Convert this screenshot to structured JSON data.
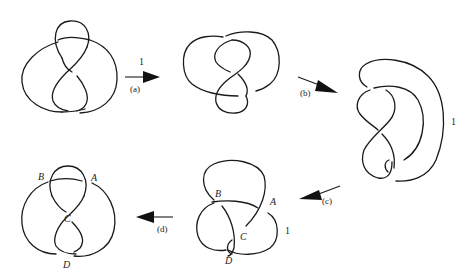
{
  "figure": {
    "knots": [
      {
        "id": "knot-1",
        "labels": []
      },
      {
        "id": "knot-2",
        "labels": [
          {
            "text": "1"
          }
        ]
      },
      {
        "id": "knot-3",
        "labels": [
          {
            "text": "1"
          }
        ]
      },
      {
        "id": "knot-4",
        "labels": [
          {
            "text": "B"
          },
          {
            "text": "A"
          },
          {
            "text": "C"
          },
          {
            "text": "D"
          },
          {
            "text": "1"
          }
        ]
      },
      {
        "id": "knot-5",
        "labels": [
          {
            "text": "B"
          },
          {
            "text": "A"
          },
          {
            "text": "C"
          },
          {
            "text": "D"
          }
        ]
      }
    ],
    "arrows": [
      {
        "id": "a",
        "label": "(a)",
        "direction": "right"
      },
      {
        "id": "b",
        "label": "(b)",
        "direction": "down-right"
      },
      {
        "id": "c",
        "label": "(c)",
        "direction": "down-left"
      },
      {
        "id": "d",
        "label": "(d)",
        "direction": "left"
      }
    ]
  },
  "colors": {
    "ink": "#1a1a1a",
    "background": "#ffffff"
  }
}
